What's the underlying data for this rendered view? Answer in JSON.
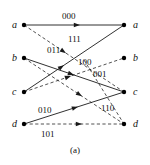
{
  "figure": {
    "caption": "(a)",
    "colors": {
      "stroke": "#1a1a1a",
      "node": "#000000",
      "text": "#111111",
      "background": "#ffffff"
    },
    "geometry": {
      "width": 150,
      "height": 165,
      "left_x": 24,
      "right_x": 124,
      "rows_y": [
        25,
        58,
        92,
        124
      ],
      "node_radius": 2.2
    }
  },
  "nodes": {
    "left": [
      {
        "id": "left-a",
        "label": "a",
        "x": 24,
        "y": 25,
        "label_x": 12,
        "label_y": 20
      },
      {
        "id": "left-b",
        "label": "b",
        "x": 24,
        "y": 58,
        "label_x": 12,
        "label_y": 53
      },
      {
        "id": "left-c",
        "label": "c",
        "x": 24,
        "y": 92,
        "label_x": 12,
        "label_y": 87
      },
      {
        "id": "left-d",
        "label": "d",
        "x": 24,
        "y": 124,
        "label_x": 12,
        "label_y": 119
      }
    ],
    "right": [
      {
        "id": "right-a",
        "label": "a",
        "x": 124,
        "y": 25,
        "label_x": 133,
        "label_y": 20
      },
      {
        "id": "right-b",
        "label": "b",
        "x": 124,
        "y": 58,
        "label_x": 133,
        "label_y": 53
      },
      {
        "id": "right-c",
        "label": "c",
        "x": 124,
        "y": 92,
        "label_x": 133,
        "label_y": 87
      },
      {
        "id": "right-d",
        "label": "d",
        "x": 124,
        "y": 124,
        "label_x": 133,
        "label_y": 119
      }
    ]
  },
  "edges": [
    {
      "id": "edge-a-a",
      "name": "edge-a-to-a",
      "from": "left-a",
      "to": "right-a",
      "x1": 24,
      "y1": 25,
      "x2": 124,
      "y2": 25,
      "style": "solid",
      "label": "000",
      "label_x": 62,
      "label_y": 12,
      "arrow_t": 0.56
    },
    {
      "id": "edge-a-c",
      "name": "edge-a-to-c",
      "from": "left-a",
      "to": "right-c",
      "x1": 24,
      "y1": 25,
      "x2": 124,
      "y2": 92,
      "style": "dashed",
      "label": "111",
      "label_x": 68,
      "label_y": 35,
      "arrow_t": 0.42
    },
    {
      "id": "edge-b-c",
      "name": "edge-b-to-c",
      "from": "left-b",
      "to": "right-c",
      "x1": 24,
      "y1": 58,
      "x2": 124,
      "y2": 92,
      "style": "solid",
      "label": "001",
      "label_x": 93,
      "label_y": 70,
      "arrow_t": 0.5
    },
    {
      "id": "edge-b-d",
      "name": "edge-b-to-d",
      "from": "left-b",
      "to": "right-d",
      "x1": 24,
      "y1": 58,
      "x2": 124,
      "y2": 124,
      "style": "dashed",
      "label": "",
      "label_x": 0,
      "label_y": 0,
      "arrow_t": 0.58
    },
    {
      "id": "edge-c-a",
      "name": "edge-c-to-a",
      "from": "left-c",
      "to": "right-a",
      "x1": 24,
      "y1": 92,
      "x2": 124,
      "y2": 25,
      "style": "solid",
      "label": "011",
      "label_x": 47,
      "label_y": 46,
      "arrow_t": 0.4
    },
    {
      "id": "edge-c-b",
      "name": "edge-c-to-b",
      "from": "left-c",
      "to": "right-b",
      "x1": 24,
      "y1": 92,
      "x2": 124,
      "y2": 58,
      "style": "dashed",
      "label": "100",
      "label_x": 78,
      "label_y": 58,
      "arrow_t": 0.47
    },
    {
      "id": "edge-d-c",
      "name": "edge-d-to-c",
      "from": "left-d",
      "to": "right-c",
      "x1": 24,
      "y1": 124,
      "x2": 124,
      "y2": 92,
      "style": "solid",
      "label": "010",
      "label_x": 38,
      "label_y": 106,
      "arrow_t": 0.54
    },
    {
      "id": "edge-d-d",
      "name": "edge-d-to-d",
      "from": "left-d",
      "to": "right-d",
      "x1": 24,
      "y1": 124,
      "x2": 124,
      "y2": 124,
      "style": "dashed",
      "label": "101",
      "label_x": 41,
      "label_y": 130,
      "arrow_t": 0.58
    },
    {
      "id": "edge-c-d-dash",
      "name": "edge-c-to-d",
      "from": "left-a2",
      "to": "right-d",
      "x1": 84,
      "y1": 60,
      "x2": 124,
      "y2": 124,
      "style": "dashed",
      "label": "110",
      "label_x": 101,
      "label_y": 104,
      "arrow_t": 0.0
    }
  ]
}
